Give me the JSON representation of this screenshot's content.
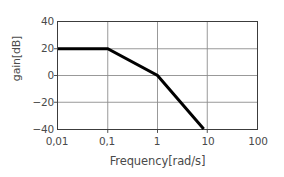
{
  "chart_data": {
    "type": "line",
    "title": "",
    "subtitle": "",
    "xlabel": "Frequency[rad/s]",
    "ylabel": "gain[dB]",
    "xscale": "log",
    "yscale": "linear",
    "xlim": [
      0.01,
      100
    ],
    "ylim": [
      -40,
      40
    ],
    "grid": true,
    "legend": null,
    "xticks": [
      {
        "value": 0.01,
        "label": "0,01"
      },
      {
        "value": 0.1,
        "label": "0,1"
      },
      {
        "value": 1,
        "label": "1"
      },
      {
        "value": 10,
        "label": "10"
      },
      {
        "value": 100,
        "label": "100"
      }
    ],
    "yticks": [
      {
        "value": 40,
        "label": "40"
      },
      {
        "value": 20,
        "label": "20"
      },
      {
        "value": 0,
        "label": "0"
      },
      {
        "value": -20,
        "label": "−20"
      },
      {
        "value": -40,
        "label": "−40"
      }
    ],
    "series": [
      {
        "name": "gain",
        "color": "#000000",
        "linewidth": 3,
        "points": [
          {
            "x": 0.01,
            "y": 20
          },
          {
            "x": 0.1,
            "y": 20
          },
          {
            "x": 1,
            "y": 0
          },
          {
            "x": 8.5,
            "y": -40
          }
        ],
        "segment_slopes_db_per_decade": [
          0,
          -20,
          -40
        ],
        "breakpoints": [
          {
            "x": 0.1,
            "y": 20
          },
          {
            "x": 1,
            "y": 0
          }
        ]
      }
    ],
    "colors": {
      "background": "#ffffff",
      "frame": "#3c3c3c",
      "grid": "#8c8c8c",
      "text": "#4a4a4a",
      "curve": "#000000"
    }
  }
}
